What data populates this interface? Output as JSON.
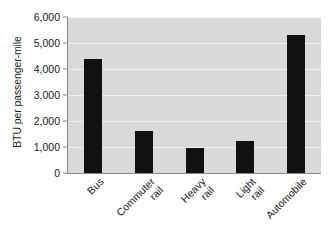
{
  "chart_data": {
    "type": "bar",
    "title": "",
    "subtitle": "",
    "xlabel": "",
    "ylabel": "BTU per passenger-mile",
    "categories": [
      "Bus",
      "Commuter rail",
      "Heavy rail",
      "Light rail",
      "Automobile"
    ],
    "category_lines": [
      [
        "Bus"
      ],
      [
        "Commuter",
        "rail"
      ],
      [
        "Heavy",
        "rail"
      ],
      [
        "Light",
        "rail"
      ],
      [
        "Automobile"
      ]
    ],
    "values": [
      4400,
      1600,
      975,
      1250,
      5300
    ],
    "ylim": [
      0,
      6000
    ],
    "ytick_values": [
      0,
      1000,
      2000,
      3000,
      4000,
      5000,
      6000
    ],
    "ytick_labels": [
      "0",
      "1,000",
      "2,000",
      "3,000",
      "4,000",
      "5,000",
      "6,000"
    ],
    "grid": true,
    "grid_axis": "y",
    "legend": false,
    "legend_position": "none",
    "bar_color": "#111111",
    "plot_background": "#d9d9d9",
    "gridline_color": "#f2f2f2",
    "axis_color": "#8a8a8a",
    "text_color": "#1a1a1a",
    "xtick_label_rotation": -45
  }
}
